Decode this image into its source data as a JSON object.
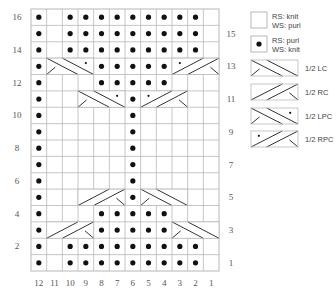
{
  "chart": {
    "columns": 12,
    "rows": 16,
    "col_numbers": [
      "12",
      "11",
      "10",
      "9",
      "8",
      "7",
      "6",
      "5",
      "4",
      "3",
      "2",
      "1"
    ],
    "left_row_labels": [
      "16",
      "14",
      "12",
      "10",
      "8",
      "6",
      "4",
      "2"
    ],
    "right_row_labels": [
      "15",
      "13",
      "11",
      "9",
      "7",
      "5",
      "3",
      "1"
    ],
    "grid_rows_top_to_bottom": [
      {
        "row": 16,
        "cells": [
          "P",
          "K",
          "P",
          "P",
          "P",
          "P",
          "P",
          "P",
          "P",
          "P",
          "P",
          "K"
        ]
      },
      {
        "row": 15,
        "cells": [
          "P",
          "K",
          "P",
          "P",
          "P",
          "P",
          "P",
          "P",
          "P",
          "P",
          "P",
          "K"
        ]
      },
      {
        "row": 14,
        "cells": [
          "P",
          "K",
          "P",
          "P",
          "P",
          "P",
          "P",
          "P",
          "P",
          "P",
          "P",
          "K"
        ]
      },
      {
        "row": 13,
        "cells": [
          "P",
          "LPC",
          "LPC",
          "LPC",
          "P",
          "P",
          "P",
          "P",
          "P",
          "RPC",
          "RPC",
          "RPC"
        ]
      },
      {
        "row": 12,
        "cells": [
          "P",
          "K",
          "K",
          "K",
          "P",
          "P",
          "P",
          "P",
          "P",
          "K",
          "K",
          "K"
        ]
      },
      {
        "row": 11,
        "cells": [
          "P",
          "K",
          "K",
          "LPC",
          "LPC",
          "LPC",
          "P",
          "RPC",
          "RPC",
          "RPC",
          "K",
          "K"
        ]
      },
      {
        "row": 10,
        "cells": [
          "P",
          "K",
          "K",
          "K",
          "K",
          "K",
          "P",
          "K",
          "K",
          "K",
          "K",
          "K"
        ]
      },
      {
        "row": 9,
        "cells": [
          "P",
          "K",
          "K",
          "K",
          "K",
          "K",
          "P",
          "K",
          "K",
          "K",
          "K",
          "K"
        ]
      },
      {
        "row": 8,
        "cells": [
          "P",
          "K",
          "K",
          "K",
          "K",
          "K",
          "P",
          "K",
          "K",
          "K",
          "K",
          "K"
        ]
      },
      {
        "row": 7,
        "cells": [
          "P",
          "K",
          "K",
          "K",
          "K",
          "K",
          "P",
          "K",
          "K",
          "K",
          "K",
          "K"
        ]
      },
      {
        "row": 6,
        "cells": [
          "P",
          "K",
          "K",
          "K",
          "K",
          "K",
          "P",
          "K",
          "K",
          "K",
          "K",
          "K"
        ]
      },
      {
        "row": 5,
        "cells": [
          "P",
          "K",
          "K",
          "RC",
          "RC",
          "RC",
          "P",
          "LC",
          "LC",
          "LC",
          "K",
          "K"
        ]
      },
      {
        "row": 4,
        "cells": [
          "P",
          "K",
          "K",
          "K",
          "P",
          "P",
          "P",
          "P",
          "P",
          "K",
          "K",
          "K"
        ]
      },
      {
        "row": 3,
        "cells": [
          "P",
          "RC",
          "RC",
          "RC",
          "P",
          "P",
          "P",
          "P",
          "P",
          "LC",
          "LC",
          "LC"
        ]
      },
      {
        "row": 2,
        "cells": [
          "P",
          "K",
          "P",
          "P",
          "P",
          "P",
          "P",
          "P",
          "P",
          "P",
          "P",
          "K"
        ]
      },
      {
        "row": 1,
        "cells": [
          "P",
          "K",
          "P",
          "P",
          "P",
          "P",
          "P",
          "P",
          "P",
          "P",
          "P",
          "K"
        ]
      }
    ]
  },
  "legend": {
    "items": [
      {
        "symbol": "K",
        "line1": "RS: knit",
        "line2": "WS: purl"
      },
      {
        "symbol": "P",
        "line1": "RS: purl",
        "line2": "WS: knit"
      },
      {
        "symbol": "LC",
        "line1": "1/2 LC",
        "line2": ""
      },
      {
        "symbol": "RC",
        "line1": "1/2 RC",
        "line2": ""
      },
      {
        "symbol": "LPC",
        "line1": "1/2 LPC",
        "line2": ""
      },
      {
        "symbol": "RPC",
        "line1": "1/2 RPC",
        "line2": ""
      }
    ]
  },
  "colors": {
    "grid_line": "#b8b8b8",
    "stroke": "#333333",
    "dot": "#111111"
  }
}
